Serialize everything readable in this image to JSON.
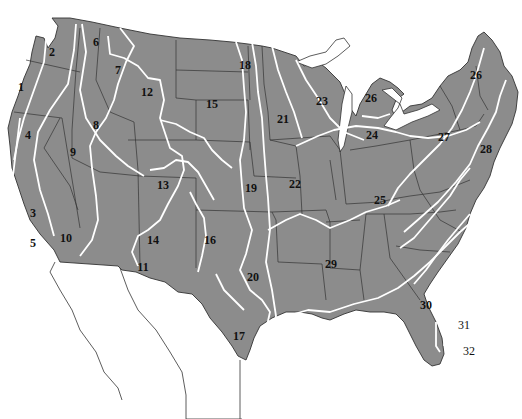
{
  "map": {
    "title": "Numbered regions of the contiguous United States",
    "colors": {
      "land": "#8c8c8c",
      "state_border": "#333333",
      "zone_line": "#ffffff",
      "water": "#ffffff",
      "mexico_outline": "#333333"
    },
    "labels": [
      {
        "id": "1",
        "x": 21,
        "y": 87
      },
      {
        "id": "2",
        "x": 52,
        "y": 52
      },
      {
        "id": "3",
        "x": 33,
        "y": 213
      },
      {
        "id": "4",
        "x": 28,
        "y": 135
      },
      {
        "id": "5",
        "x": 33,
        "y": 243
      },
      {
        "id": "6",
        "x": 96,
        "y": 42
      },
      {
        "id": "7",
        "x": 118,
        "y": 70
      },
      {
        "id": "8",
        "x": 96,
        "y": 125
      },
      {
        "id": "9",
        "x": 73,
        "y": 152
      },
      {
        "id": "10",
        "x": 66,
        "y": 238
      },
      {
        "id": "11",
        "x": 143,
        "y": 267
      },
      {
        "id": "12",
        "x": 147,
        "y": 92
      },
      {
        "id": "13",
        "x": 163,
        "y": 185
      },
      {
        "id": "14",
        "x": 153,
        "y": 240
      },
      {
        "id": "15",
        "x": 212,
        "y": 104
      },
      {
        "id": "16",
        "x": 210,
        "y": 240
      },
      {
        "id": "17",
        "x": 239,
        "y": 336
      },
      {
        "id": "18",
        "x": 245,
        "y": 65
      },
      {
        "id": "19",
        "x": 251,
        "y": 188
      },
      {
        "id": "20",
        "x": 253,
        "y": 277
      },
      {
        "id": "21",
        "x": 283,
        "y": 119
      },
      {
        "id": "22",
        "x": 295,
        "y": 184
      },
      {
        "id": "23",
        "x": 322,
        "y": 101
      },
      {
        "id": "24",
        "x": 372,
        "y": 135
      },
      {
        "id": "25",
        "x": 380,
        "y": 200
      },
      {
        "id": "26",
        "x": 371,
        "y": 98
      },
      {
        "id": "26b",
        "label": "26",
        "x": 476,
        "y": 75
      },
      {
        "id": "27",
        "x": 444,
        "y": 137
      },
      {
        "id": "28",
        "x": 486,
        "y": 149
      },
      {
        "id": "29",
        "x": 331,
        "y": 264
      },
      {
        "id": "30",
        "x": 426,
        "y": 305
      },
      {
        "id": "31",
        "x": 464,
        "y": 325,
        "outside": true
      },
      {
        "id": "32",
        "x": 469,
        "y": 351,
        "outside": true
      }
    ]
  }
}
